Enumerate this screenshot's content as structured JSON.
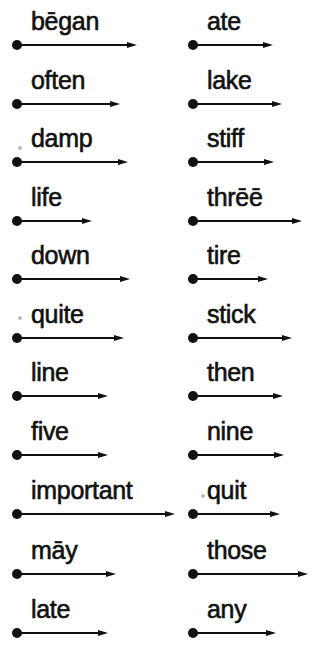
{
  "worksheet": {
    "left_column": [
      {
        "word": "bēgan",
        "y": 45,
        "end_x": 137
      },
      {
        "word": "often",
        "y": 104,
        "end_x": 120
      },
      {
        "word": "damp",
        "y": 162,
        "end_x": 128
      },
      {
        "word": "life",
        "y": 221,
        "end_x": 92
      },
      {
        "word": "down",
        "y": 279,
        "end_x": 130
      },
      {
        "word": "quite",
        "y": 338,
        "end_x": 124
      },
      {
        "word": "line",
        "y": 396,
        "end_x": 108
      },
      {
        "word": "five",
        "y": 455,
        "end_x": 108
      },
      {
        "word": "important",
        "y": 514,
        "end_x": 175
      },
      {
        "word": "māy",
        "y": 574,
        "end_x": 116
      },
      {
        "word": "late",
        "y": 633,
        "end_x": 108
      }
    ],
    "right_column": [
      {
        "word": "ate",
        "y": 45,
        "end_x": 273
      },
      {
        "word": "lake",
        "y": 104,
        "end_x": 282
      },
      {
        "word": "stiff",
        "y": 162,
        "end_x": 274
      },
      {
        "word": "thrēē",
        "y": 221,
        "end_x": 302
      },
      {
        "word": "tire",
        "y": 279,
        "end_x": 268
      },
      {
        "word": "stick",
        "y": 338,
        "end_x": 292
      },
      {
        "word": "then",
        "y": 396,
        "end_x": 283
      },
      {
        "word": "nine",
        "y": 455,
        "end_x": 284
      },
      {
        "word": "quit",
        "y": 514,
        "end_x": 280
      },
      {
        "word": "those",
        "y": 574,
        "end_x": 308
      },
      {
        "word": "any",
        "y": 633,
        "end_x": 276
      }
    ],
    "colors": {
      "ink": "#111111",
      "background": "#ffffff"
    }
  }
}
